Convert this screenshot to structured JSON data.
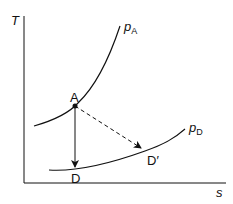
{
  "diagram": {
    "title": "",
    "type": "T-s diagram",
    "axes": {
      "y_label": "T",
      "x_label": "s"
    },
    "curves": [
      {
        "id": "pA",
        "label_main": "p",
        "label_sub": "A",
        "description": "constant pressure line p_A (steep)"
      },
      {
        "id": "pD",
        "label_main": "p",
        "label_sub": "D",
        "description": "constant pressure line p_D (shallow)"
      }
    ],
    "points": [
      {
        "id": "A",
        "label": "A"
      },
      {
        "id": "D",
        "label": "D"
      },
      {
        "id": "Dprime",
        "label": "D′"
      }
    ],
    "arrows": [
      {
        "from": "A",
        "to": "D",
        "style": "solid",
        "description": "isentropic expansion"
      },
      {
        "from": "A",
        "to": "D′",
        "style": "dashed",
        "description": "actual expansion"
      }
    ],
    "colors": {
      "line": "#111111",
      "background": "#ffffff"
    }
  }
}
